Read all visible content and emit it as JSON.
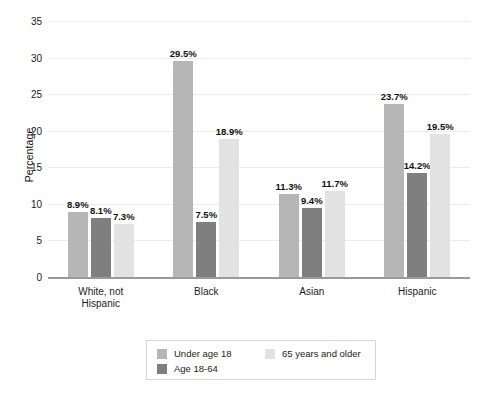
{
  "chart_data": {
    "type": "bar",
    "title": "",
    "xlabel": "",
    "ylabel": "Percentage",
    "ylim": [
      0,
      35
    ],
    "ytick_step": 5,
    "yticks": [
      "35",
      "30",
      "25",
      "20",
      "15",
      "10",
      "5",
      "0"
    ],
    "grid": true,
    "legend_position": "bottom",
    "categories": [
      "White, not\nHispanic",
      "Black",
      "Asian",
      "Hispanic"
    ],
    "series": [
      {
        "name": "Under age 18",
        "color": "#b6b6b6",
        "values": [
          8.9,
          29.5,
          11.3,
          23.7
        ],
        "labels": [
          "8.9%",
          "29.5%",
          "11.3%",
          "23.7%"
        ]
      },
      {
        "name": "Age 18-64",
        "color": "#7f7f7f",
        "values": [
          8.1,
          7.5,
          9.4,
          14.2
        ],
        "labels": [
          "8.1%",
          "7.5%",
          "9.4%",
          "14.2%"
        ]
      },
      {
        "name": "65 years and older",
        "color": "#e2e2e2",
        "values": [
          7.3,
          18.9,
          11.7,
          19.5
        ],
        "labels": [
          "7.3%",
          "18.9%",
          "11.7%",
          "19.5%"
        ]
      }
    ]
  },
  "colors": {
    "under_18": "#b6b6b6",
    "age_18_64": "#7f7f7f",
    "age_65_plus": "#e2e2e2",
    "gridline": "#ececed",
    "axis": "#9a9a9a",
    "text": "#1b1b1b",
    "background": "#ffffff",
    "legend_border": "#d5d5d5"
  }
}
